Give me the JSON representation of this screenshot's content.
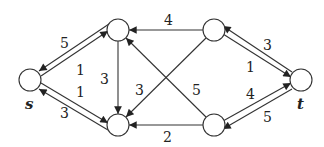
{
  "diagram": {
    "type": "flow-network",
    "nodes": [
      {
        "id": "s",
        "label": "s",
        "x": 30,
        "y": 80
      },
      {
        "id": "a",
        "label": "",
        "x": 118,
        "y": 30
      },
      {
        "id": "b",
        "label": "",
        "x": 118,
        "y": 125
      },
      {
        "id": "c",
        "label": "",
        "x": 214,
        "y": 30
      },
      {
        "id": "d",
        "label": "",
        "x": 214,
        "y": 125
      },
      {
        "id": "t",
        "label": "t",
        "x": 301,
        "y": 80
      }
    ],
    "edges": [
      {
        "from": "a",
        "to": "s",
        "weight": "5"
      },
      {
        "from": "s",
        "to": "a",
        "weight": "1"
      },
      {
        "from": "s",
        "to": "b",
        "weight": "1"
      },
      {
        "from": "b",
        "to": "s",
        "weight": "3"
      },
      {
        "from": "a",
        "to": "b",
        "weight": "3"
      },
      {
        "from": "c",
        "to": "a",
        "weight": "4"
      },
      {
        "from": "c",
        "to": "b",
        "weight": "3"
      },
      {
        "from": "d",
        "to": "a",
        "weight": "5"
      },
      {
        "from": "d",
        "to": "b",
        "weight": "2"
      },
      {
        "from": "t",
        "to": "c",
        "weight": "3"
      },
      {
        "from": "c",
        "to": "t",
        "weight": "1"
      },
      {
        "from": "d",
        "to": "t",
        "weight": "4"
      },
      {
        "from": "t",
        "to": "d",
        "weight": "5"
      }
    ],
    "labels": {
      "s": "s",
      "t": "t",
      "w_as": "5",
      "w_sa": "1",
      "w_sb": "1",
      "w_bs": "3",
      "w_ab": "3",
      "w_ca": "4",
      "w_cb": "3",
      "w_da": "5",
      "w_db": "2",
      "w_tc": "3",
      "w_ct": "1",
      "w_dt": "4",
      "w_td": "5"
    }
  }
}
